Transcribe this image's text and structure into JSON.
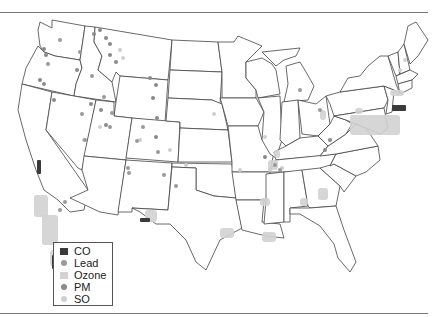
{
  "legend": {
    "items": [
      {
        "label": "CO",
        "shape": "square",
        "color": "#3a3a3a"
      },
      {
        "label": "Lead",
        "shape": "dot",
        "color": "#9a9a9a"
      },
      {
        "label": "Ozone",
        "shape": "square",
        "color": "#d2d2d2"
      },
      {
        "label": "PM",
        "shape": "dot",
        "color": "#8a8a8a"
      },
      {
        "label": "SO",
        "shape": "dot",
        "color": "#cfcfcf"
      }
    ]
  },
  "colors": {
    "co": "#3a3a3a",
    "lead": "#9a9a9a",
    "ozone": "#d2d2d2",
    "pm": "#8a8a8a",
    "so": "#cfcfcf",
    "state_line": "#444444"
  },
  "ozone_areas": [
    [
      34,
      195,
      14,
      22
    ],
    [
      42,
      215,
      16,
      30
    ],
    [
      50,
      250,
      14,
      16
    ],
    [
      145,
      210,
      12,
      12
    ],
    [
      220,
      228,
      14,
      10
    ],
    [
      262,
      232,
      14,
      10
    ],
    [
      300,
      198,
      8,
      8
    ],
    [
      318,
      188,
      10,
      12
    ],
    [
      260,
      198,
      10,
      8
    ],
    [
      274,
      150,
      6,
      8
    ],
    [
      268,
      160,
      10,
      10
    ],
    [
      320,
      110,
      6,
      10
    ],
    [
      355,
      108,
      8,
      6
    ],
    [
      390,
      90,
      14,
      6
    ],
    [
      350,
      115,
      50,
      20
    ]
  ],
  "co_areas": [
    [
      37,
      160,
      4,
      14
    ],
    [
      52,
      255,
      10,
      14
    ],
    [
      140,
      218,
      10,
      4
    ],
    [
      392,
      105,
      14,
      6
    ]
  ],
  "lead_points": [
    [
      60,
      40
    ],
    [
      48,
      64
    ],
    [
      80,
      52
    ],
    [
      92,
      76
    ],
    [
      104,
      97
    ],
    [
      82,
      114
    ],
    [
      112,
      113
    ],
    [
      85,
      140
    ],
    [
      110,
      127
    ],
    [
      143,
      127
    ],
    [
      137,
      141
    ],
    [
      128,
      168
    ],
    [
      129,
      173
    ],
    [
      164,
      175
    ],
    [
      158,
      152
    ],
    [
      176,
      186
    ],
    [
      65,
      202
    ],
    [
      60,
      210
    ],
    [
      300,
      90
    ],
    [
      320,
      110
    ],
    [
      275,
      165
    ],
    [
      280,
      170
    ]
  ],
  "pm_points": [
    [
      94,
      34
    ],
    [
      100,
      30
    ],
    [
      106,
      38
    ],
    [
      110,
      44
    ],
    [
      110,
      55
    ],
    [
      116,
      62
    ],
    [
      44,
      49
    ],
    [
      46,
      55
    ],
    [
      40,
      80
    ],
    [
      44,
      84
    ],
    [
      77,
      70
    ],
    [
      54,
      100
    ],
    [
      91,
      104
    ],
    [
      101,
      110
    ],
    [
      106,
      125
    ],
    [
      150,
      78
    ],
    [
      156,
      85
    ],
    [
      153,
      98
    ],
    [
      157,
      118
    ],
    [
      156,
      137
    ],
    [
      265,
      157
    ],
    [
      325,
      150
    ],
    [
      330,
      140
    ]
  ],
  "so_points": [
    [
      120,
      50
    ],
    [
      123,
      58
    ],
    [
      84,
      140
    ],
    [
      100,
      127
    ],
    [
      140,
      140
    ],
    [
      170,
      150
    ],
    [
      186,
      165
    ],
    [
      265,
      137
    ],
    [
      270,
      170
    ],
    [
      282,
      168
    ],
    [
      214,
      114
    ],
    [
      405,
      60
    ],
    [
      400,
      70
    ],
    [
      240,
      170
    ]
  ]
}
